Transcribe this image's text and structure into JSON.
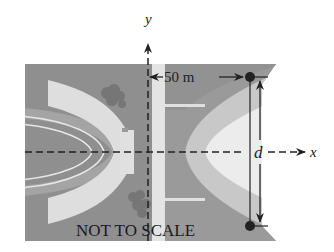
{
  "diagram": {
    "axes": {
      "x_label": "x",
      "y_label": "y"
    },
    "dimension_horizontal": {
      "label": "50 m"
    },
    "dimension_vertical": {
      "label": "d"
    },
    "caption": "NOT TO SCALE",
    "points": [
      {
        "name": "top-point",
        "cx": 250,
        "cy": 77
      },
      {
        "name": "bottom-point",
        "cx": 250,
        "cy": 226
      }
    ],
    "colors": {
      "background_dark": "#8e8e8e",
      "background_mid": "#a9a9a9",
      "track_light": "#dcdcdc",
      "road_light": "#e4e4e4",
      "field_lightest": "#f0f0f0",
      "bushes": "#767676",
      "axes": "#222222",
      "points": "#222222"
    }
  }
}
